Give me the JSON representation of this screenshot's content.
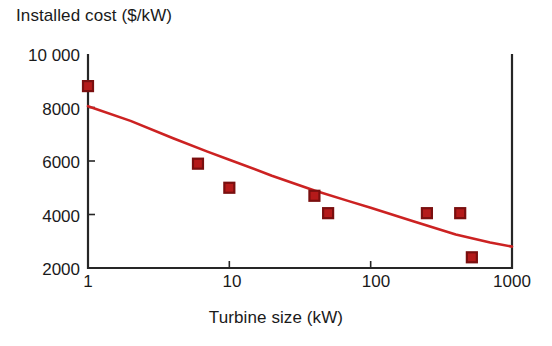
{
  "chart_data": {
    "type": "scatter",
    "title": "",
    "ylabel": "Installed cost ($/kW)",
    "xlabel": "Turbine size (kW)",
    "xscale": "log",
    "yscale": "linear",
    "xlim": [
      1,
      1000
    ],
    "ylim": [
      2000,
      10000
    ],
    "grid": false,
    "legend": null,
    "xticks": [
      "1",
      "10",
      "100",
      "1000"
    ],
    "xtick_values": [
      1,
      10,
      100,
      1000
    ],
    "yticks": [
      "10 000",
      "8000",
      "6000",
      "4000",
      "2000"
    ],
    "ytick_values": [
      10000,
      8000,
      6000,
      4000,
      2000
    ],
    "series": [
      {
        "name": "Installed cost data points",
        "marker": "square",
        "color": "#b51a1a",
        "edge_color": "#7a0f0f",
        "points": [
          {
            "x": 1,
            "y": 8800
          },
          {
            "x": 6,
            "y": 5900
          },
          {
            "x": 10,
            "y": 5000
          },
          {
            "x": 40,
            "y": 4700
          },
          {
            "x": 50,
            "y": 4050
          },
          {
            "x": 250,
            "y": 4050
          },
          {
            "x": 430,
            "y": 4050
          },
          {
            "x": 520,
            "y": 2400
          }
        ]
      },
      {
        "name": "Fitted trend curve",
        "marker": "none",
        "line": "solid",
        "color": "#cc2222",
        "points": [
          {
            "x": 1,
            "y": 8050
          },
          {
            "x": 2,
            "y": 7500
          },
          {
            "x": 4,
            "y": 6850
          },
          {
            "x": 7,
            "y": 6350
          },
          {
            "x": 10,
            "y": 6050
          },
          {
            "x": 20,
            "y": 5450
          },
          {
            "x": 40,
            "y": 4900
          },
          {
            "x": 70,
            "y": 4500
          },
          {
            "x": 100,
            "y": 4250
          },
          {
            "x": 200,
            "y": 3750
          },
          {
            "x": 400,
            "y": 3250
          },
          {
            "x": 700,
            "y": 2950
          },
          {
            "x": 1000,
            "y": 2800
          }
        ]
      }
    ]
  },
  "colors": {
    "marker_fill": "#b51a1a",
    "marker_edge": "#6e0d0d",
    "curve": "#cc2222",
    "axis": "#262626",
    "text": "#1a1a1a",
    "background": "#ffffff"
  }
}
